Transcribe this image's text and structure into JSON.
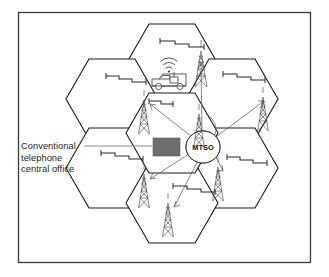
{
  "figure": {
    "frame": {
      "x": 18,
      "y": 12,
      "width": 293,
      "height": 251
    }
  },
  "labels": {
    "central_office": {
      "lines": [
        "Conventional",
        "telephone",
        "central office"
      ],
      "full_text": "Conventional telephone central office"
    },
    "mtso": "MTSO"
  },
  "colors": {
    "cell_outline": "#1a1a1a",
    "frame": "#3a3a3a",
    "building_fill": "#6e6e6e",
    "leader_line": "#8d8d8d",
    "link_line": "#5d5d5d",
    "tower": "#4a4a4a",
    "signal": "#2a2a2a",
    "text": "#262626",
    "background": "#ffffff"
  },
  "cells": [
    {
      "name": "cell-top-center",
      "cx": 172,
      "cy": 64,
      "r": 46
    },
    {
      "name": "cell-upper-left",
      "cx": 112,
      "cy": 99,
      "r": 46
    },
    {
      "name": "cell-upper-right",
      "cx": 232,
      "cy": 99,
      "r": 46
    },
    {
      "name": "cell-lower-left",
      "cx": 112,
      "cy": 168,
      "r": 46
    },
    {
      "name": "cell-lower-right",
      "cx": 232,
      "cy": 168,
      "r": 46
    },
    {
      "name": "cell-bottom-center",
      "cx": 172,
      "cy": 203,
      "r": 46
    },
    {
      "name": "cell-center",
      "cx": 172,
      "cy": 133,
      "r": 46
    }
  ],
  "towers": [
    {
      "name": "tower-top-center",
      "x": 201,
      "y": 47,
      "height": 40
    },
    {
      "name": "tower-upper-left",
      "x": 144,
      "y": 96,
      "height": 38
    },
    {
      "name": "tower-upper-right",
      "x": 263,
      "y": 93,
      "height": 38
    },
    {
      "name": "tower-center-mtso",
      "x": 199,
      "y": 110,
      "height": 40
    },
    {
      "name": "tower-lower-left",
      "x": 144,
      "y": 170,
      "height": 38
    },
    {
      "name": "tower-lower-right",
      "x": 218,
      "y": 163,
      "height": 38
    },
    {
      "name": "tower-bottom-center",
      "x": 168,
      "y": 199,
      "height": 38
    }
  ],
  "signals": [
    {
      "name": "signal-top-center",
      "x": 160,
      "y": 41,
      "width": 48
    },
    {
      "name": "signal-upper-left",
      "x": 105,
      "y": 76,
      "width": 44
    },
    {
      "name": "signal-upper-right",
      "x": 222,
      "y": 74,
      "width": 48
    },
    {
      "name": "signal-van",
      "x": 148,
      "y": 101,
      "width": 32
    },
    {
      "name": "signal-lower-left",
      "x": 100,
      "y": 153,
      "width": 48
    },
    {
      "name": "signal-lower-right",
      "x": 226,
      "y": 157,
      "width": 46
    },
    {
      "name": "signal-bottom-center",
      "x": 172,
      "y": 186,
      "width": 48
    }
  ],
  "mtso_node": {
    "cx": 203,
    "cy": 147,
    "rx": 17,
    "ry": 16
  },
  "central_office_building": {
    "x": 153,
    "y": 138,
    "width": 27,
    "height": 18
  },
  "mobile_van": {
    "x": 152,
    "y": 70,
    "width": 36,
    "height": 20
  },
  "links": [
    {
      "name": "link-mtso-to-upper-left",
      "from": [
        196,
        140
      ],
      "to": [
        150,
        104
      ]
    },
    {
      "name": "link-mtso-to-upper-right",
      "from": [
        210,
        140
      ],
      "to": [
        262,
        100
      ]
    },
    {
      "name": "link-mtso-to-top",
      "from": [
        203,
        134
      ],
      "to": [
        201,
        60
      ]
    },
    {
      "name": "link-mtso-to-lower-left",
      "from": [
        193,
        151
      ],
      "to": [
        150,
        178
      ]
    },
    {
      "name": "link-mtso-to-lower-right",
      "from": [
        213,
        152
      ],
      "to": [
        221,
        170
      ]
    },
    {
      "name": "link-mtso-to-bottom",
      "from": [
        199,
        160
      ],
      "to": [
        173,
        206
      ]
    }
  ]
}
